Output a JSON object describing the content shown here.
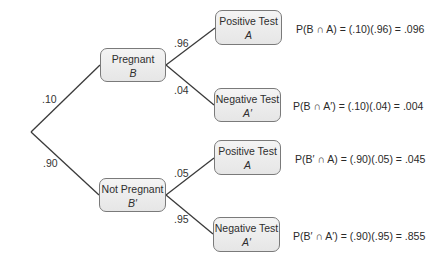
{
  "diagram": {
    "type": "probability-tree",
    "first_level": [
      {
        "label": "Pregnant",
        "symbol": "B",
        "branch_prob": ".10"
      },
      {
        "label": "Not Pregnant",
        "symbol": "B′",
        "branch_prob": ".90"
      }
    ],
    "second_level": [
      {
        "parent": "B",
        "label": "Positive Test",
        "symbol": "A",
        "branch_prob": ".96",
        "equation": "P(B ∩ A) = (.10)(.96) = .096"
      },
      {
        "parent": "B",
        "label": "Negative Test",
        "symbol": "A′",
        "branch_prob": ".04",
        "equation": "P(B ∩ A′) = (.10)(.04) = .004"
      },
      {
        "parent": "B′",
        "label": "Positive Test",
        "symbol": "A",
        "branch_prob": ".05",
        "equation": "P(B′ ∩ A) = (.90)(.05) = .045"
      },
      {
        "parent": "B′",
        "label": "Negative Test",
        "symbol": "A′",
        "branch_prob": ".95",
        "equation": "P(B′ ∩ A′) = (.90)(.95) = .855"
      }
    ]
  },
  "colors": {
    "line": "#3a3a3a",
    "node_border": "#7a7a7a",
    "node_fill": "#ececec"
  }
}
